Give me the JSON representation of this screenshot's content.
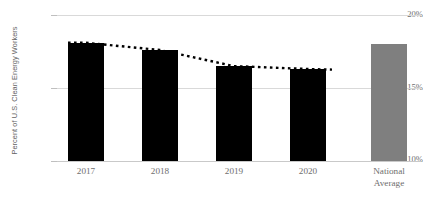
{
  "chart_data": {
    "type": "bar",
    "title": "",
    "subtitle": "",
    "xlabel": "",
    "ylabel": "Percent of U.S. Clean Energy Workers",
    "categories": [
      "2017",
      "2018",
      "2019",
      "2020",
      "National Average"
    ],
    "values": [
      18.1,
      17.6,
      16.5,
      16.3,
      18.0
    ],
    "value_labels": [
      "",
      "",
      "",
      "",
      ""
    ],
    "series": [
      {
        "name": "Percent of U.S. Clean Energy Workers",
        "values": [
          18.1,
          17.6,
          16.5,
          16.3,
          18.0
        ],
        "colors": [
          "#000000",
          "#000000",
          "#000000",
          "#000000",
          "#7f7f7f"
        ]
      },
      {
        "name": "Trend (dotted)",
        "type": "line",
        "style": "dotted",
        "color": "#000000",
        "x": [
          "2017",
          "2018",
          "2019",
          "2020"
        ],
        "values": [
          18.1,
          17.6,
          16.5,
          16.3
        ]
      }
    ],
    "ylim": [
      10,
      20
    ],
    "yticks": [
      20,
      15,
      10
    ],
    "ytick_labels": [
      "20%",
      "15%",
      "10%"
    ],
    "grid": true,
    "grid_axis": "y",
    "legend": false,
    "legend_position": "none",
    "annotations": []
  },
  "axis": {
    "y_title": "Percent of U.S. Clean Energy Workers",
    "y_ticks": [
      {
        "label": "20%",
        "value": 20
      },
      {
        "label": "15%",
        "value": 15
      },
      {
        "label": "10%",
        "value": 10
      }
    ]
  },
  "bars": [
    {
      "label": "2017",
      "value": 18.1,
      "color": "#000000"
    },
    {
      "label": "2018",
      "value": 17.6,
      "color": "#000000"
    },
    {
      "label": "2019",
      "value": 16.5,
      "color": "#000000"
    },
    {
      "label": "2020",
      "value": 16.3,
      "color": "#000000"
    },
    {
      "label_line1": "National",
      "label_line2": "Average",
      "label": "National Average",
      "value": 18.0,
      "color": "#7f7f7f"
    }
  ],
  "colors": {
    "bar_dark": "#000000",
    "bar_gray": "#7f7f7f",
    "gridline": "#d9d9d9",
    "baseline": "#c9c9c9",
    "text": "#6e6e6e",
    "trendline": "#000000"
  }
}
